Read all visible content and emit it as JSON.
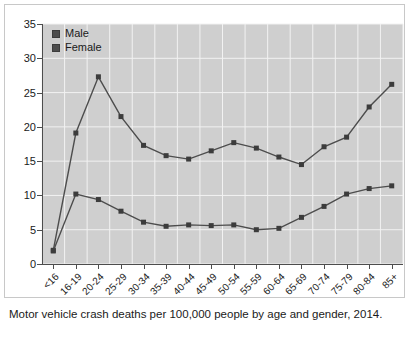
{
  "caption": "Motor vehicle crash deaths per 100,000 people by age and gender, 2014.",
  "legend": {
    "position": "top-left-inside",
    "items": [
      {
        "label": "Male",
        "color": "#4d4d4d"
      },
      {
        "label": "Female",
        "color": "#4d4d4d"
      }
    ]
  },
  "colors": {
    "plot_background": "#cfcfcf",
    "gridline": "#f2f2f2",
    "series_line": "#4d4d4d",
    "marker": "#3c3c3c",
    "axis": "#4d4d4d",
    "text": "#1a1a1a",
    "frame_border": "#c8c8c8",
    "page_background": "#ffffff"
  },
  "chart_data": {
    "type": "line",
    "title": "",
    "subtitle": "",
    "xlabel": "",
    "ylabel": "",
    "ylim": [
      0,
      35
    ],
    "yticks": [
      0,
      5,
      10,
      15,
      20,
      25,
      30,
      35
    ],
    "grid": true,
    "legend_position": "upper left",
    "categories": [
      "<16",
      "16-19",
      "20-24",
      "25-29",
      "30-34",
      "35-39",
      "40-44",
      "45-49",
      "50-54",
      "55-59",
      "60-64",
      "65-69",
      "70-74",
      "75-79",
      "80-84",
      "85+"
    ],
    "series": [
      {
        "name": "Male",
        "values": [
          2.0,
          19.1,
          27.3,
          21.5,
          17.3,
          15.8,
          15.3,
          16.5,
          17.7,
          16.9,
          15.6,
          14.5,
          17.1,
          18.5,
          22.9,
          26.2
        ]
      },
      {
        "name": "Female",
        "values": [
          1.9,
          10.2,
          9.4,
          7.7,
          6.1,
          5.5,
          5.7,
          5.6,
          5.7,
          5.0,
          5.2,
          6.8,
          8.4,
          10.2,
          11.0,
          11.4
        ]
      }
    ]
  }
}
